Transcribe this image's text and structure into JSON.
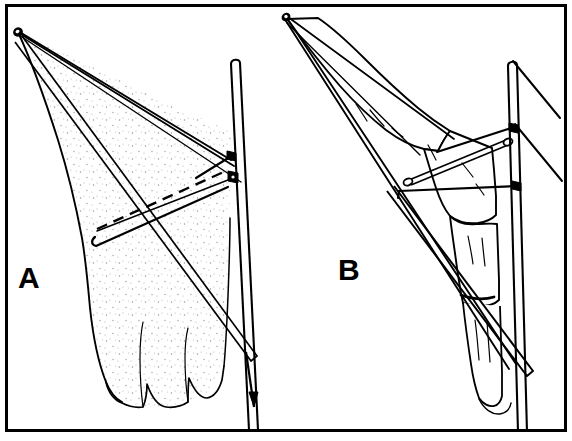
{
  "figure": {
    "kind": "line-drawing",
    "background_color": "#ffffff",
    "ink_color": "#000000",
    "border": {
      "present": true,
      "color": "#000000",
      "thickness_px": 3,
      "inset_px": 6
    },
    "panel_count": 2
  },
  "panels": [
    {
      "id": "A",
      "label": "A",
      "label_position": {
        "x": 27,
        "y": 277
      },
      "side": "left",
      "shading": "stippled",
      "description": "Stippled forearm and clenched fist drawn in perspective with converging guide lines from an apex at upper left, a dashed transverse reference line, a solid transverse bar, an oblique pin crossing the limb, and a vertical fixation rod at the right terminating in a downward arrow."
    },
    {
      "id": "B",
      "label": "B",
      "label_position": {
        "x": 347,
        "y": 268
      },
      "side": "right",
      "shading": "outline",
      "description": "Unshaded outline of the same forearm and hand from a rotated view, with converging guide lines from an apex at upper left, an oblique transfixing pin with rounded ends, a vertical fixation rod and two free oblique lines projecting to the right."
    }
  ],
  "labels": {
    "panel_a": "A",
    "panel_b": "B"
  },
  "annotations": {
    "arrow": {
      "name": "traction-direction-arrow",
      "direction": "down",
      "tip": {
        "x": 258,
        "y": 407
      },
      "panel": "A"
    }
  },
  "elements": {
    "apex_a": {
      "x": 16,
      "y": 30,
      "name": "convergence-apex-a"
    },
    "apex_b": {
      "x": 285,
      "y": 16,
      "name": "convergence-apex-b"
    },
    "vertical_rod_a": {
      "top": {
        "x": 232,
        "y": 61
      },
      "bottom": {
        "x": 252,
        "y": 430
      }
    },
    "vertical_rod_b": {
      "top": {
        "x": 512,
        "y": 64
      },
      "bottom": {
        "x": 530,
        "y": 432
      }
    },
    "dashed_line_a": {
      "from": {
        "x": 98,
        "y": 228
      },
      "to": {
        "x": 228,
        "y": 171
      }
    },
    "oblique_pin_a": {
      "from": {
        "x": 40,
        "y": 62
      },
      "to": {
        "x": 256,
        "y": 358
      }
    },
    "oblique_pin_b": {
      "from": {
        "x": 297,
        "y": 22
      },
      "to": {
        "x": 533,
        "y": 373
      }
    }
  }
}
